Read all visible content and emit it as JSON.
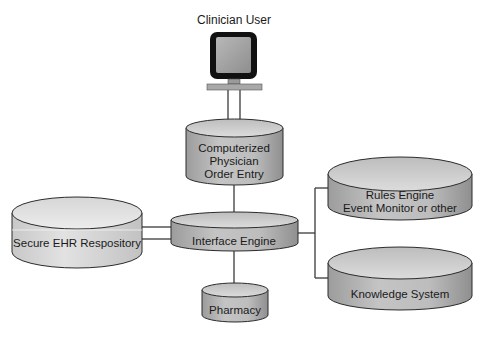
{
  "diagram": {
    "user": {
      "label": "Clinician User",
      "icon": "computer-workstation-icon"
    },
    "nodes": {
      "cpoe": {
        "lines": [
          "Computerized",
          "Physician",
          "Order Entry"
        ]
      },
      "interface_engine": {
        "lines": [
          "Interface Engine"
        ]
      },
      "ehr": {
        "lines": [
          "Secure EHR Respository"
        ]
      },
      "pharmacy": {
        "lines": [
          "Pharmacy"
        ]
      },
      "rules_engine": {
        "lines": [
          "Rules Engine",
          "Event Monitor or other"
        ]
      },
      "knowledge_system": {
        "lines": [
          "Knowledge System"
        ]
      }
    },
    "connections": [
      {
        "from": "user",
        "to": "cpoe"
      },
      {
        "from": "cpoe",
        "to": "interface_engine"
      },
      {
        "from": "ehr",
        "to": "interface_engine"
      },
      {
        "from": "interface_engine",
        "to": "pharmacy"
      },
      {
        "from": "interface_engine",
        "to": "rules_engine"
      },
      {
        "from": "interface_engine",
        "to": "knowledge_system"
      }
    ],
    "colors": {
      "cylinder_body": "#b4b4b4",
      "cylinder_top": "#d2d2d2",
      "ehr_body": "#d6d6d6",
      "ehr_top": "#e6e6e6",
      "outline": "#2b2b2b",
      "monitor_frame": "#111111",
      "monitor_screen": "#a9a9a9"
    }
  }
}
